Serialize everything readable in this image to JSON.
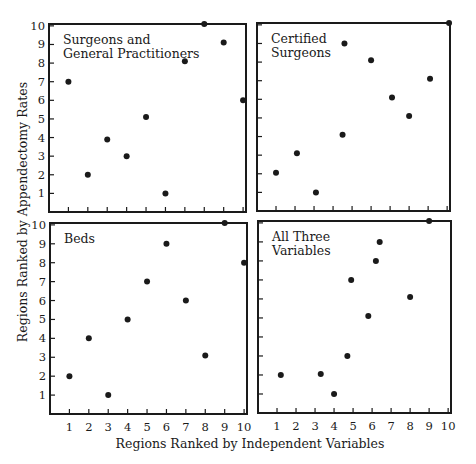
{
  "chart_data": {
    "type": "scatter",
    "xlabel": "Regions Ranked by Independent Variables",
    "ylabel": "Regions Ranked by Appendectomy Rates",
    "xlim": [
      0,
      10
    ],
    "ylim": [
      0,
      10
    ],
    "x_ticks": [
      1,
      2,
      3,
      4,
      5,
      6,
      7,
      8,
      9,
      10
    ],
    "y_ticks": [
      1,
      2,
      3,
      4,
      5,
      6,
      7,
      8,
      9,
      10
    ],
    "grid": false,
    "panels": [
      {
        "id": "top-left",
        "title_lines": [
          "Surgeons and",
          "General Practitioners"
        ],
        "frame": {
          "x0": 49,
          "x1": 246,
          "y0": 24,
          "y1": 212
        },
        "show_y_tick_labels": true,
        "show_x_tick_labels": false,
        "points": [
          [
            1,
            7
          ],
          [
            2,
            2
          ],
          [
            3,
            3.9
          ],
          [
            4,
            3
          ],
          [
            5,
            5.1
          ],
          [
            6,
            1
          ],
          [
            7,
            8.1
          ],
          [
            8,
            10.1
          ],
          [
            9,
            9.1
          ],
          [
            10,
            6
          ]
        ]
      },
      {
        "id": "top-right",
        "title_lines": [
          "Certified",
          "Surgeons"
        ],
        "frame": {
          "x0": 257,
          "x1": 450,
          "y0": 23,
          "y1": 211
        },
        "show_y_tick_labels": false,
        "show_x_tick_labels": false,
        "points": [
          [
            1,
            2.05
          ],
          [
            2.1,
            3.1
          ],
          [
            3.1,
            1
          ],
          [
            4.5,
            4.1
          ],
          [
            4.6,
            9
          ],
          [
            6,
            8.1
          ],
          [
            7.1,
            6.1
          ],
          [
            8,
            5.1
          ],
          [
            9.1,
            7.1
          ],
          [
            10.1,
            10.1
          ]
        ]
      },
      {
        "id": "bottom-left",
        "title_lines": [
          "Beds"
        ],
        "frame": {
          "x0": 50,
          "x1": 247,
          "y0": 223,
          "y1": 414
        },
        "show_y_tick_labels": true,
        "show_x_tick_labels": true,
        "points": [
          [
            1,
            2
          ],
          [
            2,
            4
          ],
          [
            3,
            1
          ],
          [
            4,
            5
          ],
          [
            5,
            7
          ],
          [
            6,
            9
          ],
          [
            7,
            6
          ],
          [
            8,
            3.1
          ],
          [
            9,
            10.1
          ],
          [
            10,
            8
          ]
        ]
      },
      {
        "id": "bottom-right",
        "title_lines": [
          "All Three",
          "Variables"
        ],
        "frame": {
          "x0": 258,
          "x1": 451,
          "y0": 221,
          "y1": 413
        },
        "show_y_tick_labels": false,
        "show_x_tick_labels": true,
        "points": [
          [
            1.2,
            2
          ],
          [
            3.3,
            2.05
          ],
          [
            4,
            1
          ],
          [
            4.7,
            3
          ],
          [
            4.9,
            7
          ],
          [
            5.8,
            5.1
          ],
          [
            6.2,
            8
          ],
          [
            6.4,
            9
          ],
          [
            8,
            6.1
          ],
          [
            9,
            10.1
          ]
        ]
      }
    ]
  },
  "labels": {
    "xlabel": "Regions Ranked by Independent Variables",
    "ylabel": "Regions Ranked by Appendectomy Rates"
  },
  "colors": {
    "ink": "#1a1a1a",
    "background": "#ffffff"
  }
}
